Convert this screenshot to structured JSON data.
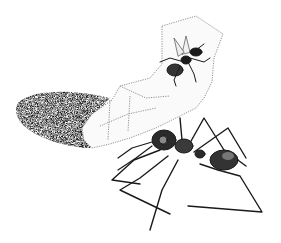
{
  "illustration": {
    "style": "pen-and-ink stipple drawing",
    "background": "#ffffff",
    "ink": "#1a1a1a",
    "elements": [
      {
        "name": "rolled-leaf-shelter",
        "description": "translucent rolled leaf / silk sheet with dark shaded cone opening at left"
      },
      {
        "name": "winged-ant",
        "description": "winged ant resting on the upper sheet"
      },
      {
        "name": "worker-ant",
        "description": "large worker ant gripping the lower edge of the sheet"
      }
    ]
  }
}
